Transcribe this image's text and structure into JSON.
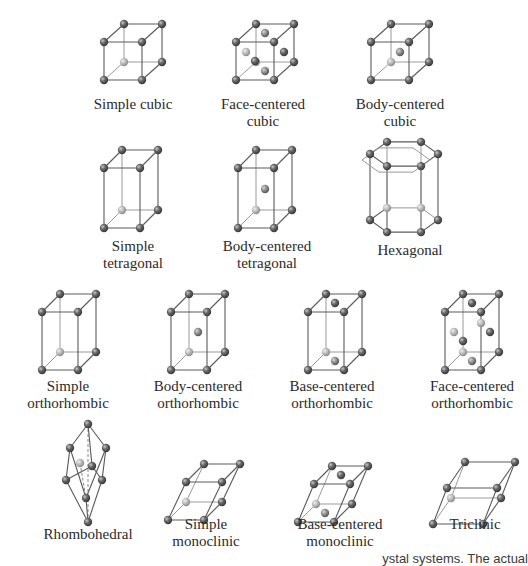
{
  "figure": {
    "atom_colors": {
      "front": "#5f5f5f",
      "back": "#a8a8a8",
      "center": "#6e6e6e"
    },
    "cells": [
      {
        "id": "simple-cubic",
        "label_lines": [
          "Simple cubic"
        ]
      },
      {
        "id": "face-centered-cubic",
        "label_lines": [
          "Face-centered",
          "cubic"
        ]
      },
      {
        "id": "body-centered-cubic",
        "label_lines": [
          "Body-centered",
          "cubic"
        ]
      },
      {
        "id": "simple-tetragonal",
        "label_lines": [
          "Simple",
          "tetragonal"
        ]
      },
      {
        "id": "body-centered-tetragonal",
        "label_lines": [
          "Body-centered",
          "tetragonal"
        ]
      },
      {
        "id": "hexagonal",
        "label_lines": [
          "Hexagonal"
        ]
      },
      {
        "id": "simple-orthorhombic",
        "label_lines": [
          "Simple",
          "orthorhombic"
        ]
      },
      {
        "id": "body-centered-orthorhombic",
        "label_lines": [
          "Body-centered",
          "orthorhombic"
        ]
      },
      {
        "id": "base-centered-orthorhombic",
        "label_lines": [
          "Base-centered",
          "orthorhombic"
        ]
      },
      {
        "id": "face-centered-orthorhombic",
        "label_lines": [
          "Face-centered",
          "orthorhombic"
        ]
      },
      {
        "id": "rhombohedral",
        "label_lines": [
          "Rhombohedral"
        ]
      },
      {
        "id": "simple-monoclinic",
        "label_lines": [
          "Simple",
          "monoclinic"
        ]
      },
      {
        "id": "base-centered-monoclinic",
        "label_lines": [
          "Base-centered",
          "monoclinic"
        ]
      },
      {
        "id": "triclinic",
        "label_lines": [
          "Triclinic"
        ]
      }
    ],
    "caption_fragment": "ystal systems. The actual"
  }
}
